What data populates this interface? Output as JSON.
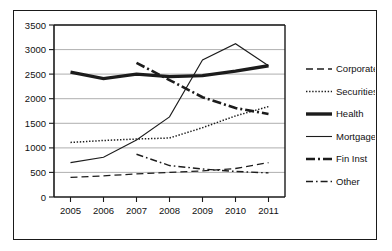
{
  "chart_data": {
    "type": "line",
    "title": "",
    "subtitle": "",
    "xlabel": "",
    "ylabel": "",
    "categories": [
      "2005",
      "2006",
      "2007",
      "2008",
      "2009",
      "2010",
      "2011"
    ],
    "x_tick_labels": [
      "2005",
      "2006",
      "2007",
      "2008",
      "2009",
      "2010",
      "2011"
    ],
    "y_tick_labels": [
      "0",
      "500",
      "1000",
      "1500",
      "2000",
      "2500",
      "3000",
      "3500"
    ],
    "y_ticks": [
      0,
      500,
      1000,
      1500,
      2000,
      2500,
      3000,
      3500
    ],
    "ylim": [
      0,
      3500
    ],
    "grid": "horizontal",
    "legend_position": "right",
    "series": [
      {
        "name": "Corporate",
        "style": "dashed",
        "width": 1.3,
        "values": [
          400,
          430,
          470,
          500,
          530,
          580,
          700
        ]
      },
      {
        "name": "Securities",
        "style": "dotted",
        "width": 1.5,
        "values": [
          1110,
          1150,
          1180,
          1200,
          1410,
          1650,
          1840
        ]
      },
      {
        "name": "Health",
        "style": "solid",
        "width": 3.4,
        "values": [
          2540,
          2410,
          2500,
          2450,
          2470,
          2560,
          2670
        ]
      },
      {
        "name": "Mortgage",
        "style": "solid",
        "width": 1.1,
        "values": [
          700,
          810,
          1160,
          1630,
          2790,
          3120,
          2670
        ]
      },
      {
        "name": "Fin Inst",
        "style": "dashdot-thick",
        "width": 2.6,
        "values": [
          null,
          null,
          2730,
          2380,
          2030,
          1810,
          1690
        ]
      },
      {
        "name": "Other",
        "style": "dashdot",
        "width": 1.4,
        "values": [
          null,
          null,
          870,
          640,
          570,
          520,
          490
        ]
      }
    ],
    "legend_entries": [
      {
        "label": "Corporate",
        "style": "dashed"
      },
      {
        "label": "Securities",
        "style": "dotted"
      },
      {
        "label": "Health",
        "style": "solid-thick"
      },
      {
        "label": "Mortgage",
        "style": "solid-thin"
      },
      {
        "label": "Fin Inst",
        "style": "dashdot-thick"
      },
      {
        "label": "Other",
        "style": "dashdot"
      }
    ],
    "colors": {
      "line": "#1c1c1c",
      "grid": "#9a9a9a",
      "axis": "#1a1a1a",
      "background": "#ffffff",
      "frame": "#1a1a1a"
    }
  }
}
